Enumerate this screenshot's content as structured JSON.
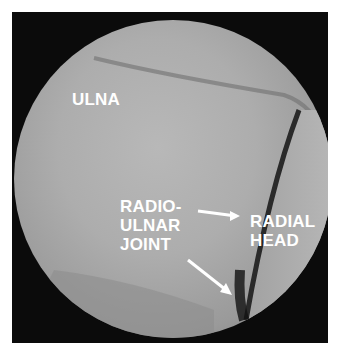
{
  "image": {
    "description": "Arthroscopic view of elbow joint (grayscale) within circular scope field",
    "labels": {
      "ulna": "ULNA",
      "radioulnar_joint": [
        "RADIO-",
        "ULNAR",
        "JOINT"
      ],
      "radial_head": [
        "RADIAL",
        "HEAD"
      ]
    },
    "colors": {
      "background": "#0b0b0b",
      "tissue": "#adadad",
      "label": "#ffffff"
    }
  }
}
